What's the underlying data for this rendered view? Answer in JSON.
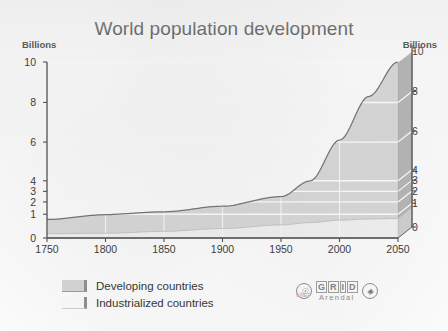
{
  "chart_data": {
    "type": "area",
    "title": "World population development",
    "xlabel": "",
    "ylabel": "Billions",
    "ylabel_right": "Billions",
    "xlim": [
      1750,
      2050
    ],
    "ylim": [
      0,
      10
    ],
    "grid": true,
    "legend_position": "bottom-left",
    "stacked": true,
    "x_ticks": [
      1750,
      1800,
      1850,
      1900,
      1950,
      2000,
      2050
    ],
    "y_ticks": [
      0,
      1,
      2,
      3,
      4,
      6,
      8,
      10
    ],
    "y_scale_note": "non-linear: compressed spacing between 0 and 4",
    "x": [
      1750,
      1800,
      1850,
      1900,
      1950,
      1975,
      2000,
      2025,
      2050
    ],
    "series": [
      {
        "name": "Industrialized countries",
        "values": [
          0.18,
          0.2,
          0.28,
          0.4,
          0.55,
          0.65,
          0.75,
          0.8,
          0.82
        ]
      },
      {
        "name": "Developing countries",
        "values": [
          0.6,
          0.78,
          0.92,
          1.25,
          1.95,
          3.35,
          5.35,
          7.5,
          9.2
        ]
      }
    ],
    "totals": [
      0.78,
      0.98,
      1.2,
      1.65,
      2.5,
      4.0,
      6.1,
      8.3,
      10.0
    ]
  },
  "header": {
    "title": "World population development",
    "unit_left": "Billions",
    "unit_right": "Billions"
  },
  "axes": {
    "y_left_ticks": [
      "10",
      "8",
      "6",
      "4",
      "3",
      "2",
      "1",
      "0"
    ],
    "y_right_ticks": [
      "10",
      "8",
      "6",
      "4",
      "3",
      "2",
      "1",
      "0"
    ],
    "x_ticks": [
      "1750",
      "1800",
      "1850",
      "1900",
      "1950",
      "2000",
      "2050"
    ]
  },
  "legend": {
    "items": [
      {
        "label": "Developing countries",
        "swatch": "developing",
        "color": "#d6d6d6"
      },
      {
        "label": "Industrialized countries",
        "swatch": "industrialized",
        "color": "#fbfbfb"
      }
    ]
  },
  "logo": {
    "left_emblem": "unep-emblem",
    "grid_letters": [
      "G",
      "R",
      "I",
      "D"
    ],
    "arendal": "Arendal",
    "sub_text": "UNEP",
    "right_emblem": "un-emblem"
  },
  "colors": {
    "developing_fill": "#d6d6d6",
    "industrialized_fill": "#fbfbfb",
    "side_face": "#b0b0b0",
    "curve_line": "#6b6b6b",
    "axis": "#4a4a4a",
    "gridline": "#ffffff"
  }
}
